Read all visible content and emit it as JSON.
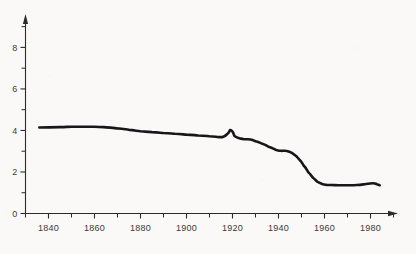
{
  "chart_data": {
    "type": "line",
    "title": "",
    "subtitle": "",
    "xlabel": "",
    "ylabel": "",
    "xlim": [
      1830,
      1990
    ],
    "ylim": [
      0,
      9.2
    ],
    "grid": false,
    "legend": false,
    "legend_position": "none",
    "y_ticks_major": [
      0,
      2,
      4,
      6,
      8
    ],
    "y_tick_labels": [
      "0",
      "2",
      "4",
      "6",
      "8"
    ],
    "y_ticks_minor": [
      1,
      3,
      5,
      7,
      9
    ],
    "x_ticks_major": [
      1840,
      1860,
      1880,
      1900,
      1920,
      1940,
      1960,
      1980
    ],
    "x_tick_labels": [
      "1840",
      "1860",
      "1880",
      "1900",
      "1920",
      "1940",
      "1960",
      "1980"
    ],
    "x_ticks_minor": [
      1830,
      1850,
      1870,
      1890,
      1910,
      1930,
      1950,
      1970,
      1990
    ],
    "series": [
      {
        "name": "series-1",
        "color": "#17161a",
        "x": [
          1836,
          1840,
          1845,
          1850,
          1855,
          1860,
          1865,
          1870,
          1875,
          1880,
          1885,
          1890,
          1895,
          1900,
          1905,
          1910,
          1914,
          1916,
          1918,
          1919,
          1920,
          1921,
          1923,
          1925,
          1928,
          1930,
          1933,
          1936,
          1939,
          1941,
          1943,
          1945,
          1947,
          1949,
          1951,
          1953,
          1955,
          1957,
          1959,
          1961,
          1963,
          1966,
          1970,
          1974,
          1978,
          1981,
          1983,
          1984
        ],
        "y": [
          4.14,
          4.15,
          4.16,
          4.18,
          4.18,
          4.18,
          4.15,
          4.1,
          4.03,
          3.96,
          3.92,
          3.88,
          3.84,
          3.8,
          3.76,
          3.72,
          3.68,
          3.7,
          3.86,
          4.02,
          3.94,
          3.72,
          3.62,
          3.58,
          3.56,
          3.48,
          3.36,
          3.2,
          3.06,
          3.02,
          3.02,
          2.96,
          2.82,
          2.6,
          2.3,
          1.98,
          1.72,
          1.52,
          1.42,
          1.38,
          1.37,
          1.36,
          1.36,
          1.37,
          1.42,
          1.46,
          1.4,
          1.36
        ]
      }
    ]
  },
  "axes": {
    "y_axis_name": "vertical-value-axis",
    "x_axis_name": "horizontal-year-axis",
    "arrow_y": "arrow-up",
    "arrow_x": "arrow-right"
  },
  "colors": {
    "background": "#faf9f7",
    "axis": "#2b2b2b",
    "curve": "#17161a",
    "label": "#3a3a3a"
  }
}
